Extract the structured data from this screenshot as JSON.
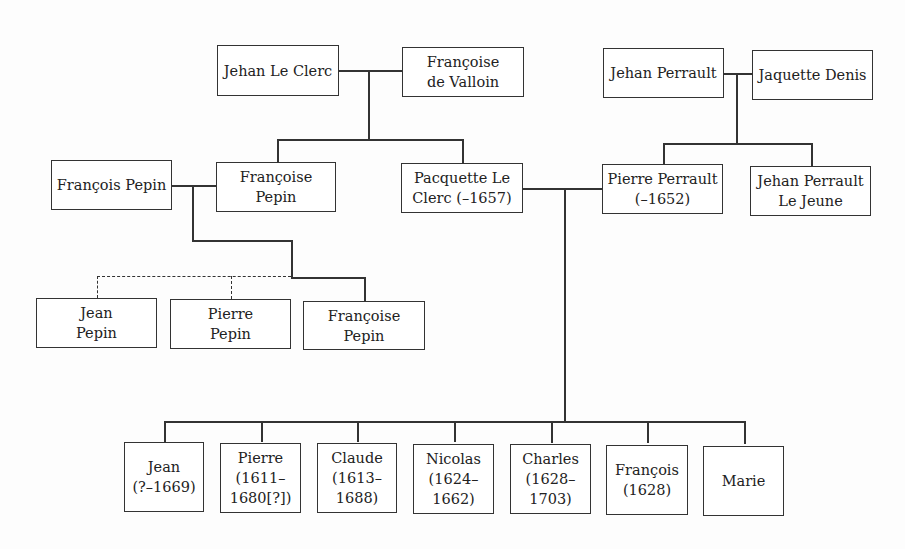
{
  "diagram": {
    "type": "family-tree",
    "generation_1": {
      "le_clerc_couple": [
        "Jehan Le Clerc",
        "Françoise\nde Valloin"
      ],
      "perrault_couple": [
        "Jehan Perrault",
        "Jaquette Denis"
      ]
    },
    "generation_2": {
      "pepin_spouse": "François Pepin",
      "le_clerc_children": [
        "Françoise Pepin",
        "Pacquette Le\nClerc (–1657)"
      ],
      "perrault_children": [
        "Pierre Perrault\n(–1652)",
        "Jehan Perrault\nLe Jeune"
      ]
    },
    "pepin_children": [
      "Jean\nPepin",
      "Pierre\nPepin",
      "Françoise\nPepin"
    ],
    "perrault_le_clerc_children": [
      "Jean\n(?–1669)",
      "Pierre\n(1611–\n1680[?])",
      "Claude\n(1613–\n1688)",
      "Nicolas\n(1624–\n1662)",
      "Charles\n(1628–\n1703)",
      "François\n(1628)",
      "Marie"
    ],
    "line_styles": {
      "uncertain_descent": "dashed",
      "descent": "solid"
    }
  }
}
